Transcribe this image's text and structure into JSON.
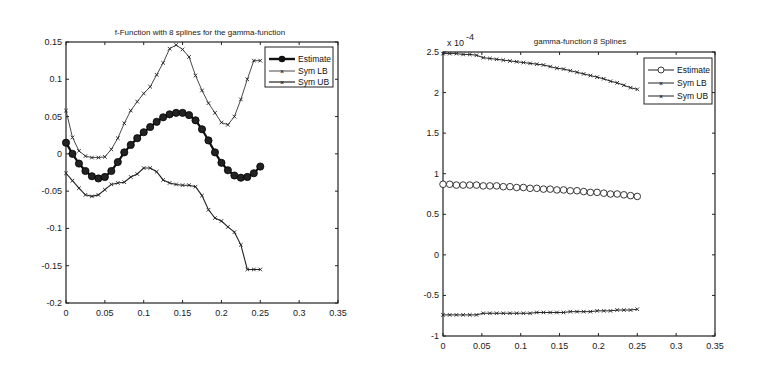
{
  "chart_data": [
    {
      "type": "line",
      "title": "f-Function with 8 splines for the gamma-function",
      "xlabel": "",
      "ylabel": "",
      "xlim": [
        0,
        0.35
      ],
      "ylim": [
        -0.2,
        0.15
      ],
      "xticks": [
        "0",
        "0.05",
        "0.1",
        "0.15",
        "0.2",
        "0.25",
        "0.3",
        "0.35"
      ],
      "yticks": [
        "0.15",
        "0.1",
        "0.05",
        "0",
        "-0.05",
        "-0.1",
        "-0.15",
        "-0.2"
      ],
      "grid": false,
      "legend_position": "upper right",
      "legend": [
        "Estimate",
        "Sym LB",
        "Sym UB"
      ],
      "x": [
        0,
        0.00833,
        0.01667,
        0.025,
        0.03333,
        0.04167,
        0.05,
        0.05833,
        0.06667,
        0.075,
        0.08333,
        0.09167,
        0.1,
        0.10833,
        0.11667,
        0.125,
        0.13333,
        0.14167,
        0.15,
        0.15833,
        0.16667,
        0.175,
        0.18333,
        0.19167,
        0.2,
        0.20833,
        0.21667,
        0.225,
        0.23333,
        0.24167,
        0.25
      ],
      "series": [
        {
          "name": "Estimate",
          "marker": "filled-circle",
          "values": [
            0.015,
            0.0,
            -0.013,
            -0.023,
            -0.03,
            -0.033,
            -0.031,
            -0.023,
            -0.011,
            0.002,
            0.012,
            0.021,
            0.029,
            0.036,
            0.043,
            0.049,
            0.053,
            0.055,
            0.055,
            0.052,
            0.045,
            0.033,
            0.018,
            0.002,
            -0.012,
            -0.022,
            -0.029,
            -0.032,
            -0.031,
            -0.026,
            -0.017
          ]
        },
        {
          "name": "Sym LB",
          "marker": "x",
          "values": [
            0.058,
            0.022,
            0.004,
            -0.003,
            -0.005,
            -0.005,
            -0.004,
            0.006,
            0.021,
            0.041,
            0.058,
            0.07,
            0.081,
            0.09,
            0.106,
            0.122,
            0.141,
            0.146,
            0.14,
            0.13,
            0.105,
            0.085,
            0.068,
            0.055,
            0.042,
            0.039,
            0.05,
            0.073,
            0.1,
            0.125,
            0.125
          ]
        },
        {
          "name": "Sym UB",
          "marker": "x",
          "values": [
            -0.026,
            -0.036,
            -0.046,
            -0.055,
            -0.057,
            -0.055,
            -0.048,
            -0.041,
            -0.039,
            -0.038,
            -0.031,
            -0.027,
            -0.019,
            -0.019,
            -0.024,
            -0.035,
            -0.039,
            -0.041,
            -0.042,
            -0.042,
            -0.044,
            -0.056,
            -0.075,
            -0.086,
            -0.09,
            -0.098,
            -0.105,
            -0.122,
            -0.155,
            -0.155,
            -0.155
          ]
        }
      ]
    },
    {
      "type": "line",
      "title": "gamma-function 8 Splines",
      "xlabel": "",
      "ylabel": "",
      "y_multiplier": "x 10^-4",
      "xlim": [
        0,
        0.35
      ],
      "ylim": [
        -1,
        2.5
      ],
      "xticks": [
        "0",
        "0.05",
        "0.1",
        "0.15",
        "0.2",
        "0.25",
        "0.3",
        "0.35"
      ],
      "yticks": [
        "2.5",
        "2",
        "1.5",
        "1",
        "0.5",
        "0",
        "-0.5",
        "-1"
      ],
      "grid": false,
      "legend_position": "upper right",
      "legend": [
        "Estimate",
        "Sym LB",
        "Sym UB"
      ],
      "x": [
        0,
        0.00862,
        0.01724,
        0.02586,
        0.03448,
        0.0431,
        0.05172,
        0.06034,
        0.06897,
        0.07759,
        0.08621,
        0.09483,
        0.10345,
        0.11207,
        0.12069,
        0.12931,
        0.13793,
        0.14655,
        0.15517,
        0.16379,
        0.17241,
        0.18103,
        0.18966,
        0.19828,
        0.2069,
        0.21552,
        0.22414,
        0.23276,
        0.24138,
        0.25
      ],
      "series": [
        {
          "name": "Estimate",
          "marker": "open-circle",
          "values": [
            0.87,
            0.87,
            0.86,
            0.86,
            0.86,
            0.86,
            0.85,
            0.85,
            0.85,
            0.84,
            0.84,
            0.83,
            0.83,
            0.82,
            0.82,
            0.81,
            0.81,
            0.8,
            0.8,
            0.79,
            0.79,
            0.78,
            0.77,
            0.77,
            0.76,
            0.75,
            0.75,
            0.74,
            0.73,
            0.72
          ]
        },
        {
          "name": "Sym LB",
          "marker": "x",
          "values": [
            2.48,
            2.48,
            2.48,
            2.47,
            2.47,
            2.46,
            2.43,
            2.42,
            2.41,
            2.4,
            2.39,
            2.38,
            2.37,
            2.36,
            2.35,
            2.34,
            2.32,
            2.3,
            2.29,
            2.27,
            2.25,
            2.23,
            2.21,
            2.19,
            2.17,
            2.14,
            2.12,
            2.09,
            2.06,
            2.04
          ]
        },
        {
          "name": "Sym UB",
          "marker": "x",
          "values": [
            -0.74,
            -0.74,
            -0.74,
            -0.74,
            -0.74,
            -0.74,
            -0.72,
            -0.72,
            -0.72,
            -0.72,
            -0.72,
            -0.72,
            -0.72,
            -0.72,
            -0.71,
            -0.71,
            -0.71,
            -0.71,
            -0.71,
            -0.7,
            -0.7,
            -0.7,
            -0.7,
            -0.69,
            -0.69,
            -0.69,
            -0.68,
            -0.68,
            -0.68,
            -0.67
          ]
        }
      ]
    }
  ]
}
